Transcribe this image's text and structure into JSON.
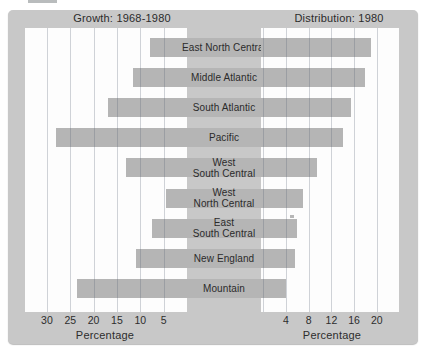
{
  "header": {
    "left_title": "Growth: 1968-1980",
    "right_title": "Distribution: 1980"
  },
  "axes": {
    "left_xlabel": "Percentage",
    "right_xlabel": "Percentage"
  },
  "chart_data": {
    "type": "bar",
    "layout": "paired-horizontal-bars",
    "title_left": "Growth: 1968-1980",
    "title_right": "Distribution: 1980",
    "categories": [
      "East North Central",
      "Middle Atlantic",
      "South Atlantic",
      "Pacific",
      "West South Central",
      "West North Central",
      "East South Central",
      "New England",
      "Mountain"
    ],
    "categories_display": [
      "East North Central",
      "Middle Atlantic",
      "South Atlantic",
      "Pacific",
      "West\nSouth Central",
      "West\nNorth Central",
      "East\nSouth Central",
      "New England",
      "Mountain"
    ],
    "series": [
      {
        "name": "Growth: 1968-1980",
        "side": "left",
        "direction": "right-to-left",
        "unit": "percent",
        "values": [
          8,
          11.5,
          17,
          28,
          13,
          4.5,
          7.5,
          11,
          23.5
        ],
        "xlabel": "Percentage",
        "tick_labels": [
          30,
          25,
          20,
          15,
          10,
          5
        ],
        "gridlines": [
          5,
          10,
          15,
          20,
          25,
          30
        ],
        "xlim": [
          0,
          34.7
        ]
      },
      {
        "name": "Distribution: 1980",
        "side": "right",
        "direction": "left-to-right",
        "unit": "percent",
        "values": [
          19,
          18,
          15.5,
          14,
          9.5,
          7,
          6,
          5.5,
          4
        ],
        "xlabel": "Percentage",
        "tick_labels": [
          4,
          8,
          12,
          16,
          20
        ],
        "gridlines": [
          0,
          4,
          8,
          12,
          16,
          20
        ],
        "xlim": [
          0,
          24.3
        ]
      }
    ],
    "grid": "vertical",
    "legend": "none",
    "colors": {
      "background": "#c8c8c8",
      "panel": "#fdfdfd",
      "bar": "#b5b5b5",
      "gridline": "#ccd1d7",
      "text": "#2d2d2d"
    }
  }
}
